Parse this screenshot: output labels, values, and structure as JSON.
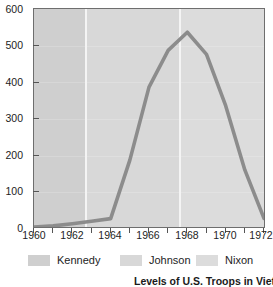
{
  "chart_data": {
    "type": "line",
    "title": "Levels of U.S. Troops in Vietnam",
    "xlabel": "",
    "ylabel": "",
    "xlim": [
      1960,
      1972
    ],
    "ylim": [
      0,
      600
    ],
    "grid": false,
    "legend_position": "bottom",
    "line_color": "#8c8c8c",
    "plot_background": "#d9d9d9",
    "x": [
      1960,
      1961,
      1962,
      1963,
      1964,
      1965,
      1966,
      1967,
      1968,
      1969,
      1970,
      1971,
      1972
    ],
    "values": [
      0,
      3,
      9,
      16,
      23,
      184,
      385,
      486,
      536,
      475,
      334,
      157,
      24
    ],
    "series": [
      {
        "name": "U.S. troops in Vietnam (thousands)",
        "values": [
          0,
          3,
          9,
          16,
          23,
          184,
          385,
          486,
          536,
          475,
          334,
          157,
          24
        ]
      }
    ],
    "peak": {
      "x": 1968,
      "y": 536
    },
    "y_ticks": [
      0,
      100,
      200,
      300,
      400,
      500,
      600
    ],
    "y_tick_labels": [
      "0",
      "100",
      "200",
      "300",
      "400",
      "500",
      "600"
    ],
    "x_ticks": [
      1960,
      1961,
      1962,
      1963,
      1964,
      1965,
      1966,
      1967,
      1968,
      1969,
      1970,
      1971,
      1972
    ],
    "x_tick_labels": [
      "1960",
      "",
      "1962",
      "",
      "1964",
      "",
      "1966",
      "",
      "1968",
      "",
      "1970",
      "",
      "1972"
    ],
    "bands": [
      {
        "name": "Kennedy",
        "start": 1960,
        "end": 1963.0,
        "color": "#cfcfcf"
      },
      {
        "name": "Johnson",
        "start": 1963.0,
        "end": 1968.5,
        "color": "#d8d8d8"
      },
      {
        "name": "Nixon",
        "start": 1968.5,
        "end": 1972,
        "color": "#dcdcdc"
      }
    ],
    "legend": [
      {
        "label": "Kennedy",
        "color": "#cfcfcf"
      },
      {
        "label": "Johnson",
        "color": "#d8d8d8"
      },
      {
        "label": "Nixon",
        "color": "#dcdcdc"
      }
    ]
  },
  "axis": {
    "y_labels": [
      "600",
      "500",
      "400",
      "300",
      "200",
      "100",
      "0"
    ],
    "x_labels": [
      "1960",
      "1962",
      "1964",
      "1966",
      "1968",
      "1970",
      "1972"
    ]
  },
  "legend": {
    "items": [
      {
        "label": "Kennedy"
      },
      {
        "label": "Johnson"
      },
      {
        "label": "Nixon"
      }
    ]
  },
  "caption": {
    "text": "Levels of U.S. Troops in Vietnam"
  }
}
